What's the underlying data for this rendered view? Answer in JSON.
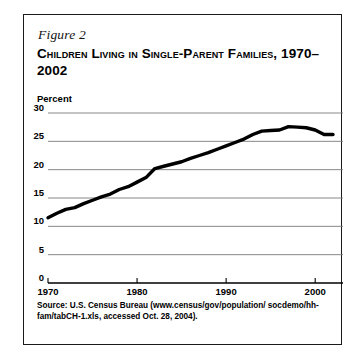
{
  "figure": {
    "label": "Figure 2",
    "title": "Children Living in Single-Parent Families, 1970–2002",
    "source": "Source: U.S. Census Bureau (www.census/gov/population/ socdemo/hh-fam/tabCH-1.xls, accessed Oct. 28, 2004)."
  },
  "axis": {
    "y_title": "Percent",
    "y_ticks": [
      "30",
      "25",
      "20",
      "15",
      "10",
      "5",
      "0"
    ],
    "x_ticks": [
      "1970",
      "1980",
      "1990",
      "2000"
    ]
  },
  "colors": {
    "line": "#000000",
    "grid": "#7a7a7a",
    "axis": "#000000",
    "frame": "#1a1a1a",
    "background": "#ffffff"
  },
  "chart_data": {
    "type": "line",
    "title": "Children Living in Single-Parent Families, 1970–2002",
    "xlabel": "",
    "ylabel": "Percent",
    "xlim": [
      1970,
      2002
    ],
    "ylim": [
      0,
      30
    ],
    "grid": true,
    "legend": "none",
    "yticks": [
      0,
      5,
      10,
      15,
      20,
      25,
      30
    ],
    "xticks": [
      1970,
      1980,
      1990,
      2000
    ],
    "series": [
      {
        "name": "Children living in single-parent families",
        "units": "percent",
        "x": [
          1970,
          1971,
          1972,
          1973,
          1974,
          1975,
          1976,
          1977,
          1978,
          1979,
          1980,
          1981,
          1982,
          1983,
          1984,
          1985,
          1986,
          1987,
          1988,
          1989,
          1990,
          1991,
          1992,
          1993,
          1994,
          1995,
          1996,
          1997,
          1998,
          1999,
          2000,
          2001,
          2002
        ],
        "values": [
          11.5,
          12.3,
          13.0,
          13.3,
          14.0,
          14.6,
          15.2,
          15.7,
          16.5,
          17.0,
          17.8,
          18.6,
          20.2,
          20.6,
          21.0,
          21.4,
          22.0,
          22.5,
          23.0,
          23.6,
          24.2,
          24.8,
          25.4,
          26.2,
          26.8,
          26.9,
          27.0,
          27.6,
          27.5,
          27.4,
          27.0,
          26.2,
          26.2
        ]
      }
    ]
  }
}
